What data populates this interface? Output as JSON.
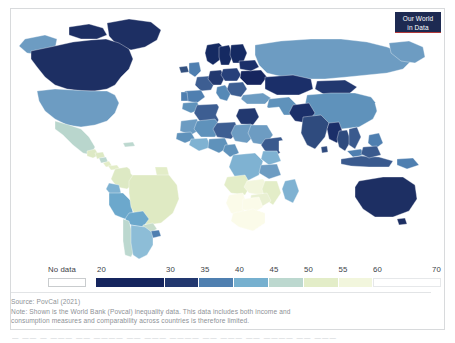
{
  "logo": {
    "line1": "Our World",
    "line2": "in Data",
    "bg_color": "#1d2a52",
    "accent_color": "#b33a3a"
  },
  "legend": {
    "no_data_label": "No data",
    "no_data_color": "#ffffff",
    "tick_labels": [
      "20",
      "30",
      "35",
      "40",
      "45",
      "50",
      "55",
      "60",
      "70"
    ],
    "tick_values": [
      20,
      30,
      35,
      40,
      45,
      50,
      55,
      60,
      70
    ],
    "bins": [
      {
        "from": 20,
        "to": 30,
        "color": "#15255e"
      },
      {
        "from": 30,
        "to": 35,
        "color": "#22386f"
      },
      {
        "from": 35,
        "to": 40,
        "color": "#4f7fb0"
      },
      {
        "from": 40,
        "to": 45,
        "color": "#76b0cf"
      },
      {
        "from": 45,
        "to": 50,
        "color": "#bcd8cf"
      },
      {
        "from": 50,
        "to": 55,
        "color": "#e3edc8"
      },
      {
        "from": 55,
        "to": 60,
        "color": "#f2f6dd"
      },
      {
        "from": 60,
        "to": 70,
        "color": "#ffffff"
      }
    ]
  },
  "footer": {
    "source": "Source: PovCal (2021)",
    "note_line1": "Note: Shown is the World Bank (Povcal) inequality data. This data includes both income and",
    "note_line2": "consumption measures and comparability across countries is therefore limited."
  },
  "chart_data": {
    "type": "choropleth-map",
    "title": "",
    "unit": "Gini index",
    "legend_position": "bottom",
    "value_range": [
      20,
      70
    ],
    "bin_edges": [
      20,
      30,
      35,
      40,
      45,
      50,
      55,
      60,
      70
    ],
    "bin_colors": [
      "#15255e",
      "#22386f",
      "#4f7fb0",
      "#76b0cf",
      "#bcd8cf",
      "#e3edc8",
      "#f2f6dd",
      "#ffffff"
    ],
    "no_data_color": "#ffffff",
    "countries": [
      {
        "name": "Canada",
        "bin": 0,
        "color": "#1d2f63"
      },
      {
        "name": "Greenland",
        "bin": 0,
        "color": "#1d2f63"
      },
      {
        "name": "United States",
        "bin": 2,
        "color": "#6d9cc2"
      },
      {
        "name": "Mexico",
        "bin": 4,
        "color": "#b9d6cd"
      },
      {
        "name": "Guatemala",
        "bin": 5,
        "color": "#dde9c4"
      },
      {
        "name": "Honduras",
        "bin": 5,
        "color": "#dde9c4"
      },
      {
        "name": "Nicaragua",
        "bin": 4,
        "color": "#bcd8cf"
      },
      {
        "name": "Costa Rica",
        "bin": 5,
        "color": "#e3edc8"
      },
      {
        "name": "Panama",
        "bin": 5,
        "color": "#e3edc8"
      },
      {
        "name": "Cuba",
        "bin": null,
        "color": "#ffffff"
      },
      {
        "name": "Colombia",
        "bin": 5,
        "color": "#dde9c4"
      },
      {
        "name": "Venezuela",
        "bin": null,
        "color": "#ffffff"
      },
      {
        "name": "Ecuador",
        "bin": 3,
        "color": "#7fb2d2"
      },
      {
        "name": "Peru",
        "bin": 3,
        "color": "#6ca8cc"
      },
      {
        "name": "Bolivia",
        "bin": 3,
        "color": "#6ca8cc"
      },
      {
        "name": "Brazil",
        "bin": 5,
        "color": "#dfeac3"
      },
      {
        "name": "Chile",
        "bin": 4,
        "color": "#bcd8cf"
      },
      {
        "name": "Argentina",
        "bin": 3,
        "color": "#8dbdd7"
      },
      {
        "name": "Paraguay",
        "bin": 4,
        "color": "#c6dccb"
      },
      {
        "name": "Uruguay",
        "bin": 2,
        "color": "#4f7fb0"
      },
      {
        "name": "United Kingdom",
        "bin": 2,
        "color": "#4f7fb0"
      },
      {
        "name": "Ireland",
        "bin": 1,
        "color": "#33507f"
      },
      {
        "name": "France",
        "bin": 1,
        "color": "#3d5e92"
      },
      {
        "name": "Spain",
        "bin": 2,
        "color": "#4f7fb0"
      },
      {
        "name": "Portugal",
        "bin": 2,
        "color": "#4f7fb0"
      },
      {
        "name": "Germany",
        "bin": 0,
        "color": "#22386f"
      },
      {
        "name": "Italy",
        "bin": 2,
        "color": "#5689b6"
      },
      {
        "name": "Norway",
        "bin": 0,
        "color": "#152a62"
      },
      {
        "name": "Sweden",
        "bin": 0,
        "color": "#152a62"
      },
      {
        "name": "Finland",
        "bin": 0,
        "color": "#152a62"
      },
      {
        "name": "Poland",
        "bin": 0,
        "color": "#27407a"
      },
      {
        "name": "Ukraine",
        "bin": 0,
        "color": "#16255e"
      },
      {
        "name": "Russia",
        "bin": 2,
        "color": "#6d9cc2"
      },
      {
        "name": "Turkey",
        "bin": 2,
        "color": "#6d9cc2"
      },
      {
        "name": "Kazakhstan",
        "bin": 0,
        "color": "#1b2f69"
      },
      {
        "name": "Iran",
        "bin": 2,
        "color": "#5f92bb"
      },
      {
        "name": "Saudi Arabia",
        "bin": null,
        "color": "#ffffff"
      },
      {
        "name": "Egypt",
        "bin": 0,
        "color": "#22386f"
      },
      {
        "name": "Algeria",
        "bin": 1,
        "color": "#3d5e92"
      },
      {
        "name": "Morocco",
        "bin": 2,
        "color": "#5f92bb"
      },
      {
        "name": "Libya",
        "bin": null,
        "color": "#ffffff"
      },
      {
        "name": "Sudan",
        "bin": 2,
        "color": "#6d9cc2"
      },
      {
        "name": "Ethiopia",
        "bin": 1,
        "color": "#3a5a8e"
      },
      {
        "name": "Nigeria",
        "bin": 2,
        "color": "#5f92bb"
      },
      {
        "name": "Niger",
        "bin": 1,
        "color": "#3d5e92"
      },
      {
        "name": "Mali",
        "bin": 2,
        "color": "#5f92bb"
      },
      {
        "name": "Mauritania",
        "bin": 2,
        "color": "#6d9cc2"
      },
      {
        "name": "Chad",
        "bin": 2,
        "color": "#6d9cc2"
      },
      {
        "name": "Kenya",
        "bin": 3,
        "color": "#7fb2d2"
      },
      {
        "name": "Tanzania",
        "bin": 2,
        "color": "#6d9cc2"
      },
      {
        "name": "Congo (Dem. Rep.)",
        "bin": 3,
        "color": "#7fb2d2"
      },
      {
        "name": "Angola",
        "bin": 5,
        "color": "#e3edc8"
      },
      {
        "name": "Zambia",
        "bin": 6,
        "color": "#f2f6dd"
      },
      {
        "name": "Zimbabwe",
        "bin": 5,
        "color": "#e9f0d2"
      },
      {
        "name": "Mozambique",
        "bin": 5,
        "color": "#e3edc8"
      },
      {
        "name": "Madagascar",
        "bin": 3,
        "color": "#7fb2d2"
      },
      {
        "name": "Namibia",
        "bin": 7,
        "color": "#fbfbe9"
      },
      {
        "name": "Botswana",
        "bin": 7,
        "color": "#fbfbe9"
      },
      {
        "name": "South Africa",
        "bin": 7,
        "color": "#fbfbe9"
      },
      {
        "name": "India",
        "bin": 1,
        "color": "#2f4b7e"
      },
      {
        "name": "Pakistan",
        "bin": 0,
        "color": "#1b2f69"
      },
      {
        "name": "China",
        "bin": 2,
        "color": "#5f92bb"
      },
      {
        "name": "Mongolia",
        "bin": 0,
        "color": "#22386f"
      },
      {
        "name": "Japan",
        "bin": null,
        "color": "#ffffff"
      },
      {
        "name": "Indonesia",
        "bin": 1,
        "color": "#3a5a8e"
      },
      {
        "name": "Thailand",
        "bin": 1,
        "color": "#2f4b7e"
      },
      {
        "name": "Vietnam",
        "bin": 1,
        "color": "#3a5a8e"
      },
      {
        "name": "Philippines",
        "bin": 2,
        "color": "#4f7fb0"
      },
      {
        "name": "Myanmar",
        "bin": 0,
        "color": "#1b2f69"
      },
      {
        "name": "Malaysia",
        "bin": 2,
        "color": "#4f7fb0"
      },
      {
        "name": "Papua New Guinea",
        "bin": 2,
        "color": "#4f7fb0"
      },
      {
        "name": "Australia",
        "bin": 0,
        "color": "#1d2f63"
      },
      {
        "name": "New Zealand",
        "bin": null,
        "color": "#ffffff"
      }
    ]
  }
}
